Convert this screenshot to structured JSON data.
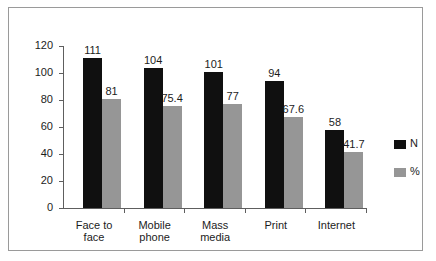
{
  "chart_data": {
    "type": "bar",
    "title": "",
    "subtitle": "",
    "xlabel": "",
    "ylabel": "",
    "categories": [
      "Face to\nface",
      "Mobile\nphone",
      "Mass\nmedia",
      "Print",
      "Internet"
    ],
    "series": [
      {
        "name": "N",
        "color": "#101010",
        "values": [
          111,
          104,
          101,
          94,
          58
        ],
        "labels": [
          "111",
          "104",
          "101",
          "94",
          "58"
        ]
      },
      {
        "name": "%",
        "color": "#969696",
        "values": [
          81,
          75.4,
          77,
          67.6,
          41.7
        ],
        "labels": [
          "81",
          "75.4",
          "77",
          "67.6",
          "41.7"
        ]
      }
    ],
    "ylim": [
      0,
      120
    ],
    "yticks": [
      0,
      20,
      40,
      60,
      80,
      100,
      120
    ],
    "ytick_labels": [
      "0",
      "20",
      "40",
      "60",
      "80",
      "100",
      "120"
    ],
    "grid": false,
    "legend": {
      "position": "right",
      "entries": [
        "N",
        "%"
      ]
    }
  }
}
